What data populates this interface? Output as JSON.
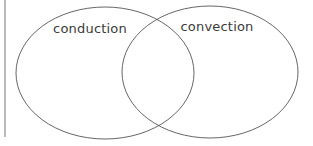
{
  "diagram": {
    "type": "venn",
    "sets": [
      {
        "id": "left",
        "label": "conduction",
        "cx": 105,
        "cy": 73,
        "rx": 89,
        "ry": 66,
        "label_x": 90,
        "label_y": 33
      },
      {
        "id": "right",
        "label": "convection",
        "cx": 210,
        "cy": 72,
        "rx": 88,
        "ry": 66,
        "label_x": 217,
        "label_y": 31
      }
    ],
    "stroke_color": "#555555",
    "margin_line": {
      "x": 5,
      "y1": 0,
      "y2": 137,
      "color": "#8a8a8a"
    }
  }
}
